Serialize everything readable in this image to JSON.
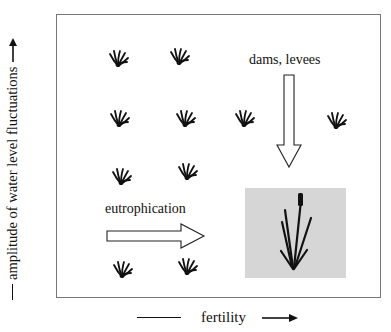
{
  "diagram": {
    "y_axis_label": "amplitude of water level fluctuations",
    "x_axis_label": "fertility",
    "annotations": {
      "vertical_arrow_label": "dams, levees",
      "horizontal_arrow_label": "eutrophication"
    },
    "icons": {
      "small_plant": "small-plant-icon",
      "reed": "reed-plant-icon",
      "down_arrow": "hollow-down-arrow-icon",
      "right_arrow": "hollow-right-arrow-icon"
    },
    "small_plant_positions": [
      {
        "x": 108,
        "y": 48
      },
      {
        "x": 169,
        "y": 46
      },
      {
        "x": 109,
        "y": 108
      },
      {
        "x": 175,
        "y": 108
      },
      {
        "x": 234,
        "y": 108
      },
      {
        "x": 326,
        "y": 110
      },
      {
        "x": 111,
        "y": 166
      },
      {
        "x": 177,
        "y": 161
      },
      {
        "x": 112,
        "y": 259
      },
      {
        "x": 177,
        "y": 256
      }
    ],
    "colors": {
      "frame_border": "#777777",
      "reed_box_fill": "#d6d6d6",
      "ink": "#111111"
    }
  }
}
